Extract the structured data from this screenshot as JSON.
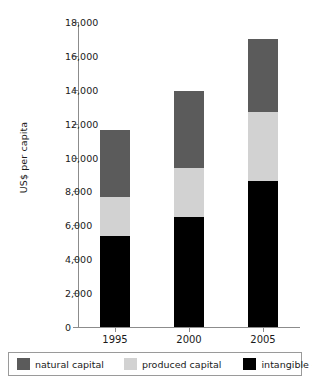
{
  "chart_data": {
    "type": "bar",
    "subtype": "stacked-bar",
    "title": "",
    "xlabel": "",
    "ylabel": "US$ per capita",
    "categories": [
      "1995",
      "2000",
      "2005"
    ],
    "ylim": [
      0,
      18000
    ],
    "ytick_step": 2000,
    "ytick_labels": [
      "18,000",
      "16,000",
      "14,000",
      "12,000",
      "10,000",
      "8,000",
      "6,000",
      "4,000",
      "2,000",
      "0"
    ],
    "ytick_values": [
      18000,
      16000,
      14000,
      12000,
      10000,
      8000,
      6000,
      4000,
      2000,
      0
    ],
    "grid": false,
    "legend_position": "bottom",
    "stack_order_bottom_to_top": [
      "intangible capital",
      "produced capital",
      "natural capital"
    ],
    "series": [
      {
        "name": "intangible capital",
        "color": "#000000",
        "values": [
          5400,
          6500,
          8600
        ]
      },
      {
        "name": "produced capital",
        "color": "#d2d2d2",
        "values": [
          2300,
          2900,
          4100
        ]
      },
      {
        "name": "natural capital",
        "color": "#5b5b5b",
        "values": [
          3900,
          4500,
          4300
        ]
      }
    ],
    "totals": [
      11600,
      13900,
      17000
    ]
  },
  "legend": {
    "items": [
      {
        "label": "natural capital",
        "color": "#5b5b5b"
      },
      {
        "label": "produced capital",
        "color": "#d2d2d2"
      },
      {
        "label": "intangible capital",
        "color": "#000000"
      }
    ]
  },
  "colors": {
    "natural": "#5b5b5b",
    "produced": "#d2d2d2",
    "intangible": "#000000",
    "axis": "#8c8c8c",
    "text": "#1a1a1a",
    "background": "#ffffff"
  }
}
